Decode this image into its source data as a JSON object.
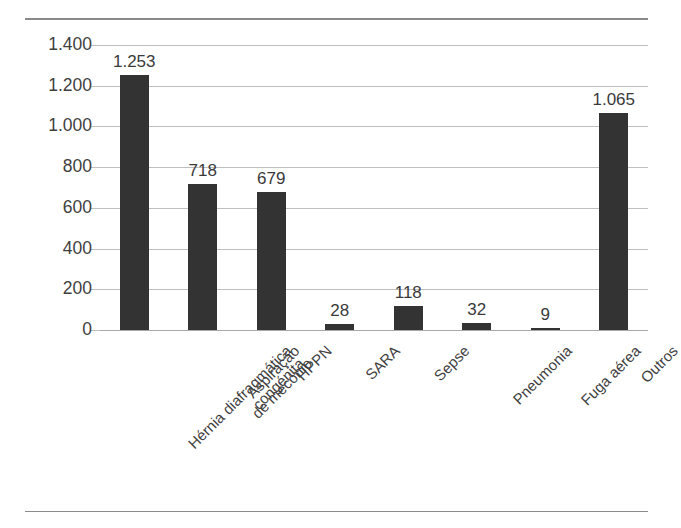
{
  "chart_data": {
    "type": "bar",
    "title": "",
    "subtitle": "",
    "xlabel": "",
    "ylabel": "",
    "categories": [
      "Hérnia diafragmática\ncongénita",
      "Aspiração\nde mecónio",
      "HPPN",
      "SARA",
      "Sepse",
      "Pneumonia",
      "Fuga aérea",
      "Outros"
    ],
    "values": [
      1253,
      718,
      679,
      28,
      118,
      32,
      9,
      1065
    ],
    "data_labels": [
      "1.253",
      "718",
      "679",
      "28",
      "118",
      "32",
      "9",
      "1.065"
    ],
    "ylim": [
      0,
      1400
    ],
    "ytick_values": [
      0,
      200,
      400,
      600,
      800,
      1000,
      1200,
      1400
    ],
    "ytick_labels": [
      "0",
      "200",
      "400",
      "600",
      "800",
      "1.000",
      "1.200",
      "1.400"
    ],
    "grid": true,
    "legend": false,
    "legend_position": "none",
    "bar_color": "#333333",
    "gridline_color": "#bfbfbf",
    "axis_color": "#a8a8a8",
    "text_color": "#3f3f3f",
    "decimal_separator": "."
  }
}
